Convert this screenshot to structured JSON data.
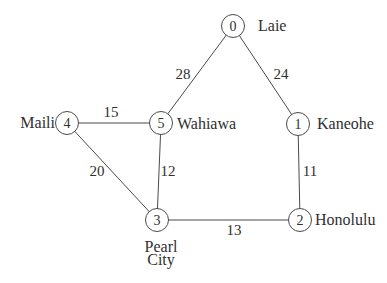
{
  "figure": {
    "width": 387,
    "height": 283,
    "background": "#ffffff",
    "line_color": "#4a4a4a",
    "text_color": "#2f2f2f",
    "node_fill": "#ffffff",
    "node_radius": 11.5
  },
  "graph": {
    "type": "undirected-weighted-graph",
    "nodes": [
      {
        "id": "0",
        "name": "Laie",
        "x": 233,
        "y": 26,
        "label": {
          "lines": [
            "Laie"
          ],
          "x": 258,
          "y": 25,
          "anchor": "start"
        }
      },
      {
        "id": "1",
        "name": "Kaneohe",
        "x": 298,
        "y": 124,
        "label": {
          "lines": [
            "Kaneohe"
          ],
          "x": 317,
          "y": 123,
          "anchor": "start"
        }
      },
      {
        "id": "2",
        "name": "Honolulu",
        "x": 300,
        "y": 220,
        "label": {
          "lines": [
            "Honolulu"
          ],
          "x": 315,
          "y": 219,
          "anchor": "start"
        }
      },
      {
        "id": "3",
        "name": "Pearl City",
        "x": 157,
        "y": 220,
        "label": {
          "lines": [
            "Pearl",
            "City"
          ],
          "x": 161,
          "y": 246,
          "anchor": "middle"
        }
      },
      {
        "id": "4",
        "name": "Maili",
        "x": 67,
        "y": 123,
        "label": {
          "lines": [
            "Maili"
          ],
          "x": 55,
          "y": 122,
          "anchor": "end"
        }
      },
      {
        "id": "5",
        "name": "Wahiawa",
        "x": 161,
        "y": 123,
        "label": {
          "lines": [
            "Wahiawa"
          ],
          "x": 177,
          "y": 123,
          "anchor": "start"
        }
      }
    ],
    "edges": [
      {
        "from": "0",
        "to": "5",
        "weight": "28",
        "label_x": 183,
        "label_y": 74
      },
      {
        "from": "0",
        "to": "1",
        "weight": "24",
        "label_x": 281,
        "label_y": 74
      },
      {
        "from": "4",
        "to": "5",
        "weight": "15",
        "label_x": 111,
        "label_y": 112
      },
      {
        "from": "4",
        "to": "3",
        "weight": "20",
        "label_x": 97,
        "label_y": 171
      },
      {
        "from": "5",
        "to": "3",
        "weight": "12",
        "label_x": 168,
        "label_y": 171
      },
      {
        "from": "1",
        "to": "2",
        "weight": "11",
        "label_x": 310,
        "label_y": 171
      },
      {
        "from": "3",
        "to": "2",
        "weight": "13",
        "label_x": 234,
        "label_y": 230
      }
    ]
  }
}
